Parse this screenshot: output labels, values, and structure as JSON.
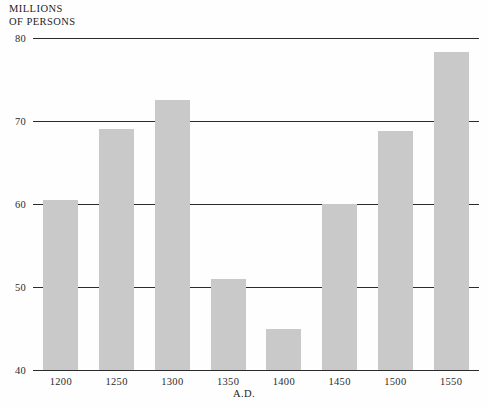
{
  "chart_data": {
    "type": "bar",
    "title": "",
    "subtitle": "",
    "ylabel": "MILLIONS OF PERSONS",
    "ylabel_lines": [
      "MILLIONS",
      "OF PERSONS"
    ],
    "xlabel": "A.D.",
    "categories": [
      "1200",
      "1250",
      "1300",
      "1350",
      "1400",
      "1450",
      "1500",
      "1550"
    ],
    "values": [
      60.5,
      69,
      72.5,
      51,
      45,
      60,
      68.8,
      78.3
    ],
    "ylim": [
      40,
      80
    ],
    "yticks": [
      40,
      50,
      60,
      70,
      80
    ],
    "ytick_labels": [
      "40",
      "50",
      "60",
      "70",
      "80"
    ],
    "grid": "horizontal",
    "legend": "none",
    "bar_color": "#c9c9c9",
    "axis_color": "#2b2b2b",
    "background_color": "#fefefe"
  }
}
